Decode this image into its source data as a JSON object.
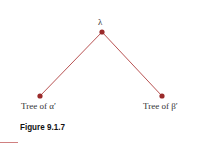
{
  "figure": {
    "caption": "Figure 9.1.7",
    "root": {
      "label": "λ",
      "x": 102,
      "y": 32
    },
    "children": [
      {
        "label": "Tree of α′",
        "x": 40,
        "y": 96
      },
      {
        "label": "Tree of  β′",
        "x": 162,
        "y": 96
      }
    ],
    "colors": {
      "node": "#9a2a2a",
      "edge": "#b04040",
      "rule": "#d08080"
    }
  }
}
